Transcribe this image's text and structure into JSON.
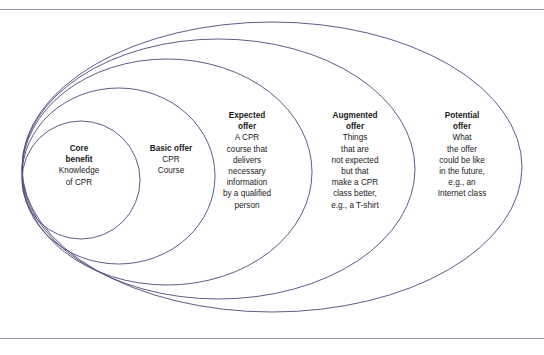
{
  "diagram": {
    "type": "nested-ellipse-levels-of-product",
    "line_color": "#4a4a7a",
    "background_color": "#ffffff",
    "rule_color": "#9a9ab4",
    "rings": [
      {
        "id": "core-benefit",
        "title": "Core\nbenefit",
        "title_line1": "Core",
        "title_line2": "benefit",
        "body": "Knowledge\nof CPR",
        "body_lines": [
          "Knowledge",
          "of CPR"
        ]
      },
      {
        "id": "basic-offer",
        "title": "Basic offer",
        "title_line1": "Basic offer",
        "title_line2": "",
        "body": "CPR\nCourse",
        "body_lines": [
          "CPR",
          "Course"
        ]
      },
      {
        "id": "expected-offer",
        "title": "Expected\noffer",
        "title_line1": "Expected",
        "title_line2": "offer",
        "body": "A CPR\ncourse that\ndelivers\nnecessary\ninformation\nby a qualified\nperson",
        "body_lines": [
          "A CPR",
          "course that",
          "delivers",
          "necessary",
          "information",
          "by a qualified",
          "person"
        ]
      },
      {
        "id": "augmented-offer",
        "title": "Augmented\noffer",
        "title_line1": "Augmented",
        "title_line2": "offer",
        "body": "Things\nthat are\nnot expected\nbut that\nmake a CPR\nclass better,\ne.g., a T-shirt",
        "body_lines": [
          "Things",
          "that are",
          "not expected",
          "but that",
          "make a CPR",
          "class better,",
          "e.g., a T-shirt"
        ]
      },
      {
        "id": "potential-offer",
        "title": "Potential\noffer",
        "title_line1": "Potential",
        "title_line2": "offer",
        "body": "What\nthe offer\ncould be like\nin the future,\ne.g., an\nInternet class",
        "body_lines": [
          "What",
          "the offer",
          "could be like",
          "in the future,",
          "e.g., an",
          "Internet class"
        ]
      }
    ]
  }
}
